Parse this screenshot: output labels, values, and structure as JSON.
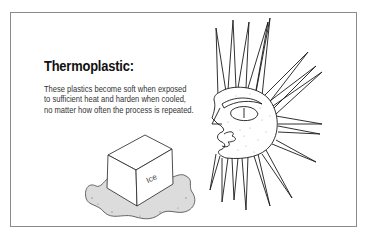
{
  "panel": {
    "title": "Thermoplastic:",
    "description_lines": [
      "These plastics become soft when exposed",
      "to sufficient heat and harden when cooled,",
      "no matter how often the process is repeated."
    ]
  },
  "illustrations": {
    "ice_cube": {
      "label": "Ice",
      "icon": "melting-ice-cube-icon"
    },
    "sun": {
      "icon": "sun-face-icon"
    }
  },
  "colors": {
    "border": "#8a8a8a",
    "ink": "#1a1a1a",
    "puddle": "#d9d9d9"
  }
}
